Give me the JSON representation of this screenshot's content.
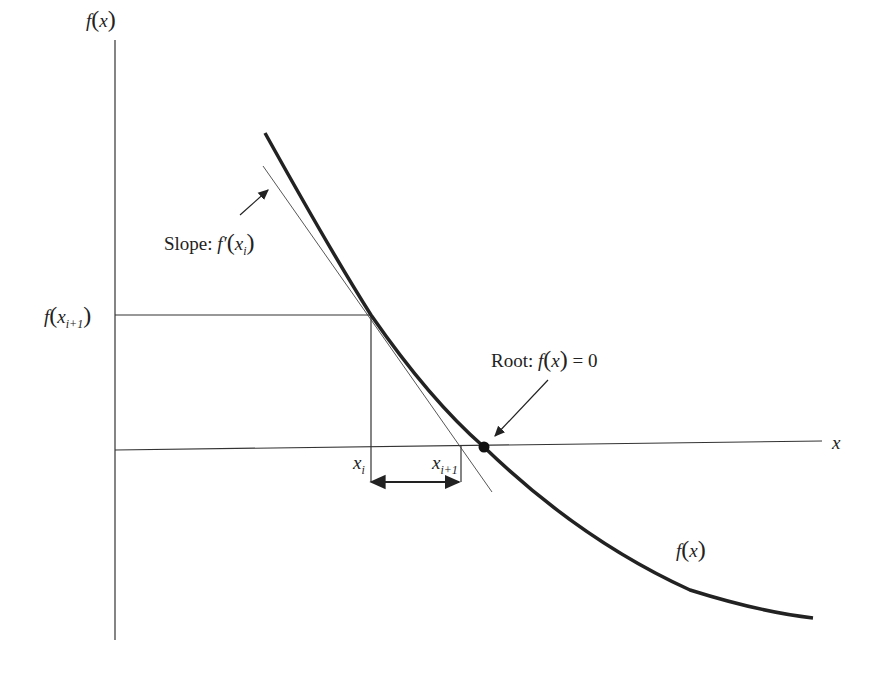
{
  "diagram": {
    "labels": {
      "y_axis": {
        "func": "f",
        "arg": "x"
      },
      "x_axis": "x",
      "slope": {
        "prefix": "Slope: ",
        "func": "f′",
        "arg": "x",
        "sub": "i"
      },
      "f_xi1": {
        "func": "f",
        "arg": "x",
        "sub": "i+1"
      },
      "root": {
        "prefix": "Root: ",
        "func": "f",
        "arg": "x",
        "suffix": " = 0"
      },
      "xi": {
        "var": "x",
        "sub": "i"
      },
      "xi1": {
        "var": "x",
        "sub": "i+1"
      },
      "curve": {
        "func": "f",
        "arg": "x"
      }
    },
    "colors": {
      "curve": "#222222",
      "axes": "#333333",
      "tangent": "#444444",
      "background": "#ffffff"
    }
  }
}
